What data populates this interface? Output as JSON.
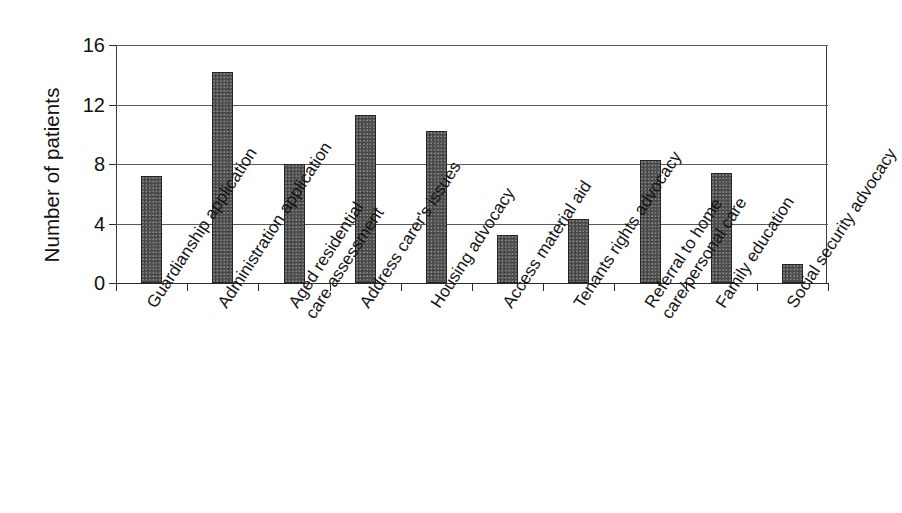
{
  "chart_data": {
    "type": "bar",
    "title": "",
    "subtitle": "",
    "xlabel": "",
    "ylabel": "Number of patients",
    "ylim": [
      0,
      16
    ],
    "yticks": [
      0,
      4,
      8,
      12,
      16
    ],
    "ytick_labels": [
      "0",
      "4",
      "8",
      "12",
      "16"
    ],
    "grid": "horizontal",
    "legend": "none",
    "bar_color": "#4e4e4e",
    "bar_edge_color": "#242424",
    "background_color": "#ffffff",
    "axis_color": "#2b2b2b",
    "categories": [
      "Guardianship application",
      "Administration application",
      "Aged residential care assessment",
      "Address carer's issues",
      "Housing advocacy",
      "Access material aid",
      "Tenants rights advocacy",
      "Referral to home care/personal care",
      "Family education",
      "Social security advocacy"
    ],
    "category_lines": [
      [
        "Guardianship application"
      ],
      [
        "Administration application"
      ],
      [
        "Aged residential",
        "care assessment"
      ],
      [
        "Address carer's issues"
      ],
      [
        "Housing advocacy"
      ],
      [
        "Access material aid"
      ],
      [
        "Tenants rights advocacy"
      ],
      [
        "Referral to home",
        "care/personal care"
      ],
      [
        "Family education"
      ],
      [
        "Social security advocacy"
      ]
    ],
    "values": [
      7.2,
      14.2,
      8.0,
      11.3,
      10.2,
      3.2,
      4.3,
      8.3,
      7.4,
      1.3
    ]
  }
}
